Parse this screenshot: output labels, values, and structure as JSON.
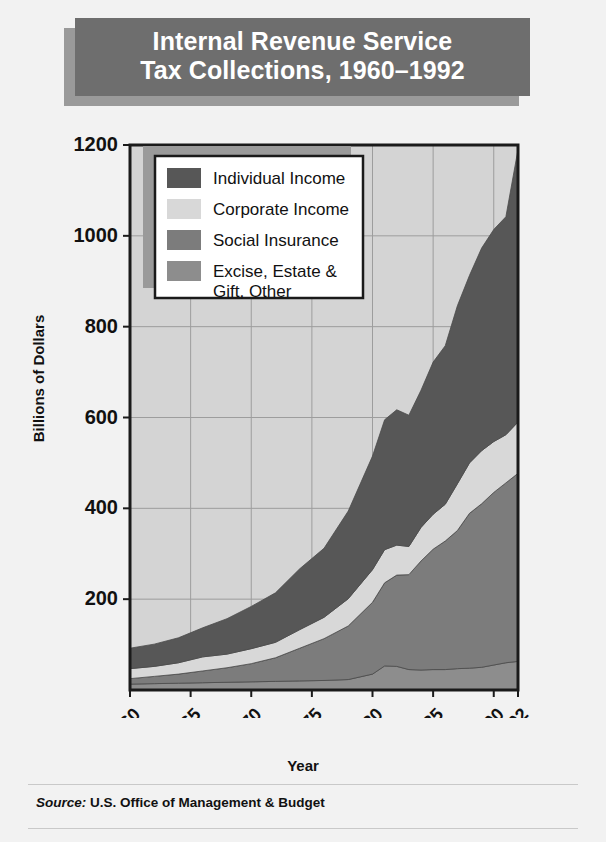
{
  "title": {
    "line1": "Internal Revenue Service",
    "line2": "Tax Collections, 1960–1992"
  },
  "source": {
    "label": "Source:",
    "text": " U.S. Office of Management & Budget"
  },
  "colors": {
    "page_background": "#f2f2f2",
    "banner": "#6e6e6e",
    "banner_shadow": "#9a9a9a",
    "banner_text": "#ffffff",
    "plot_background": "#d4d4d4",
    "gridline": "#9d9d9d",
    "axis": "#1a1a1a",
    "individual_income": "#575757",
    "corporate_income": "#d8d8d8",
    "social_insurance": "#7c7c7c",
    "excise_other": "#8d8d8d",
    "legend_background": "#ffffff",
    "legend_border": "#1a1a1a",
    "legend_shadow": "#9a9a9a"
  },
  "chart_data": {
    "type": "area",
    "stacked": true,
    "title": "Internal Revenue Service Tax Collections, 1960–1992",
    "xlabel": "Year",
    "ylabel": "Billions of Dollars",
    "ylim": [
      0,
      1200
    ],
    "yticks": [
      200,
      400,
      600,
      800,
      1000,
      1200
    ],
    "ytick_labels": [
      "200",
      "400",
      "600",
      "800",
      "1000",
      "1200"
    ],
    "xlim": [
      1960,
      1992
    ],
    "xticks": [
      1960,
      1965,
      1970,
      1975,
      1980,
      1985,
      1990,
      1992
    ],
    "xtick_labels": [
      "1960",
      "1965",
      "1970",
      "1975",
      "1980",
      "1985",
      "1990",
      "1992\n(est.)"
    ],
    "xtick_rotation": -45,
    "grid": true,
    "legend_position": "upper-left-inside",
    "x": [
      1960,
      1962,
      1964,
      1966,
      1968,
      1970,
      1972,
      1974,
      1976,
      1978,
      1980,
      1981,
      1982,
      1983,
      1984,
      1985,
      1986,
      1987,
      1988,
      1989,
      1990,
      1991,
      1992
    ],
    "series": [
      {
        "name": "Excise, Estate & Gift, Other",
        "color": "#8d8d8d",
        "values": [
          13,
          14,
          15,
          16,
          17,
          18,
          19,
          20,
          21,
          23,
          35,
          53,
          52,
          45,
          44,
          45,
          45,
          47,
          48,
          50,
          55,
          60,
          63
        ]
      },
      {
        "name": "Social Insurance",
        "color": "#7c7c7c",
        "values": [
          12,
          16,
          20,
          26,
          32,
          40,
          52,
          72,
          92,
          118,
          158,
          183,
          201,
          209,
          240,
          265,
          283,
          304,
          341,
          360,
          380,
          396,
          414
        ]
      },
      {
        "name": "Corporate Income",
        "color": "#d8d8d8",
        "values": [
          22,
          22,
          25,
          31,
          30,
          33,
          34,
          41,
          47,
          60,
          72,
          73,
          66,
          62,
          74,
          77,
          81,
          103,
          111,
          117,
          112,
          106,
          113
        ]
      },
      {
        "name": "Individual Income",
        "color": "#575757",
        "values": [
          45,
          49,
          55,
          64,
          78,
          93,
          109,
          134,
          152,
          193,
          250,
          286,
          298,
          289,
          302,
          335,
          349,
          392,
          413,
          446,
          467,
          480,
          600
        ]
      }
    ],
    "totals": [
      92,
      101,
      115,
      137,
      157,
      184,
      214,
      267,
      312,
      394,
      515,
      595,
      617,
      605,
      660,
      722,
      758,
      846,
      913,
      973,
      1014,
      1042,
      1190
    ],
    "legend": [
      "Individual Income",
      "Corporate Income",
      "Social Insurance",
      "Excise, Estate & Gift, Other"
    ]
  }
}
